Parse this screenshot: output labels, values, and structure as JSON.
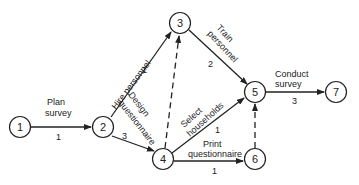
{
  "diagram": {
    "type": "activity network (CPM/PERT)",
    "nodes": [
      {
        "id": "1",
        "label": "1"
      },
      {
        "id": "2",
        "label": "2"
      },
      {
        "id": "3",
        "label": "3"
      },
      {
        "id": "4",
        "label": "4"
      },
      {
        "id": "5",
        "label": "5"
      },
      {
        "id": "6",
        "label": "6"
      },
      {
        "id": "7",
        "label": "7"
      }
    ],
    "edges": [
      {
        "from": "1",
        "to": "2",
        "activity_line1": "Plan",
        "activity_line2": "survey",
        "duration": "1",
        "style": "solid"
      },
      {
        "from": "2",
        "to": "3",
        "activity": "Hire personnel",
        "duration": "1",
        "style": "solid"
      },
      {
        "from": "2",
        "to": "4",
        "activity_line1": "Design",
        "activity_line2": "questionnaire",
        "duration": "3",
        "style": "solid"
      },
      {
        "from": "3",
        "to": "5",
        "activity_line1": "Train",
        "activity_line2": "personnel",
        "duration": "2",
        "style": "solid"
      },
      {
        "from": "4",
        "to": "3",
        "activity": "",
        "duration": "",
        "style": "dashed"
      },
      {
        "from": "4",
        "to": "5",
        "activity_line1": "Select",
        "activity_line2": "households",
        "duration": "1",
        "style": "solid"
      },
      {
        "from": "4",
        "to": "6",
        "activity_line1": "Print",
        "activity_line2": "questionnaire",
        "duration": "1",
        "style": "solid"
      },
      {
        "from": "6",
        "to": "5",
        "activity": "",
        "duration": "",
        "style": "dashed"
      },
      {
        "from": "5",
        "to": "7",
        "activity_line1": "Conduct",
        "activity_line2": "survey",
        "duration": "3",
        "style": "solid"
      }
    ]
  }
}
